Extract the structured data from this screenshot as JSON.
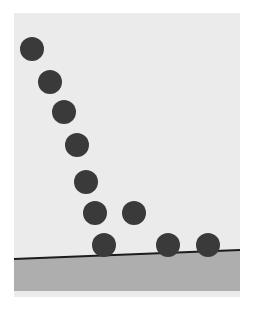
{
  "figure": {
    "caption": "Multi-flash (strobe) photograph style illustration: a dark ball falls, strikes a slightly inclined ground plane, and bounces with decreasing height."
  },
  "canvas": {
    "width": 256,
    "height": 324,
    "page_background": "#ffffff"
  },
  "frame": {
    "x": 14,
    "y": 13,
    "width": 226,
    "height": 284,
    "background_color": "#ebebeb",
    "label": "photo-frame"
  },
  "ground": {
    "label": "inclined ground surface",
    "line_color": "#1c1c1c",
    "line_width": 2,
    "band_color": "#aeaeae",
    "left_x": 14,
    "left_y": 259,
    "right_x": 240,
    "right_y": 250,
    "band_bottom_y": 291,
    "incline_note": "surface rises slightly from left to right"
  },
  "ball": {
    "label": "ball",
    "color": "#3a3a3a",
    "radius": 12,
    "count": 10
  },
  "chart_data": {
    "type": "scatter",
    "xlabel": "horizontal position (px)",
    "ylabel": "vertical position (px, screen coords)",
    "xlim": [
      14,
      240
    ],
    "ylim": [
      297,
      13
    ],
    "grid": false,
    "legend": "none",
    "series": [
      {
        "name": "ball positions",
        "marker": "filled circle",
        "color": "#3a3a3a",
        "marker_radius": 12,
        "points": [
          {
            "index": 1,
            "x": 32,
            "y": 49,
            "phase": "first fall"
          },
          {
            "index": 2,
            "x": 50,
            "y": 82,
            "phase": "first fall"
          },
          {
            "index": 3,
            "x": 64,
            "y": 112,
            "phase": "first fall"
          },
          {
            "index": 4,
            "x": 77,
            "y": 145,
            "phase": "first fall"
          },
          {
            "index": 5,
            "x": 86,
            "y": 182,
            "phase": "first fall"
          },
          {
            "index": 6,
            "x": 95,
            "y": 213,
            "phase": "first fall"
          },
          {
            "index": 7,
            "x": 104,
            "y": 245,
            "phase": "first ground contact"
          },
          {
            "index": 8,
            "x": 134,
            "y": 213,
            "phase": "first bounce apex"
          },
          {
            "index": 9,
            "x": 168,
            "y": 245,
            "phase": "second ground contact"
          },
          {
            "index": 10,
            "x": 208,
            "y": 245,
            "phase": "rolling on ground"
          }
        ]
      }
    ]
  }
}
